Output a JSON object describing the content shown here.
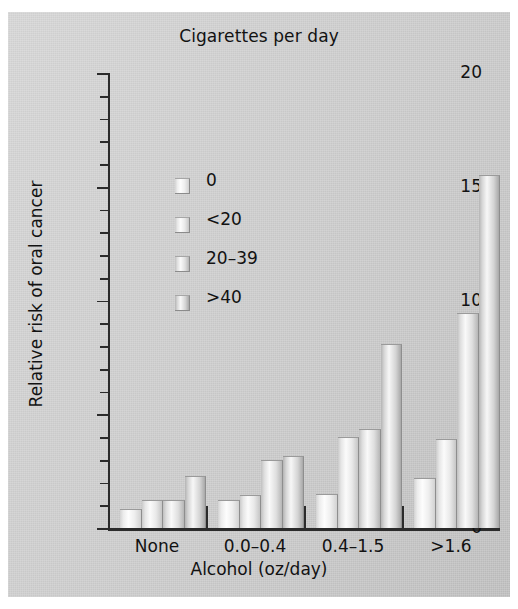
{
  "chart_data": {
    "type": "bar",
    "title": "Cigarettes per day",
    "xlabel": "Alcohol (oz/day)",
    "ylabel": "Relative risk of oral cancer",
    "categories": [
      "None",
      "0.0–0.4",
      "0.4–1.5",
      ">1.6"
    ],
    "legend_title": "Cigarettes per day",
    "legend_position": "inside-upper-left",
    "grid": false,
    "ylim": [
      0,
      20
    ],
    "yticks": [
      0,
      5,
      10,
      15,
      20
    ],
    "ytick_labels": [
      "0",
      "5",
      "10",
      "15",
      "20"
    ],
    "minor_tick_interval": 1,
    "series": [
      {
        "name": "0",
        "values": [
          0.85,
          1.25,
          1.5,
          2.2
        ]
      },
      {
        "name": "<20",
        "values": [
          1.25,
          1.45,
          4.0,
          3.9
        ]
      },
      {
        "name": "20–39",
        "values": [
          1.25,
          3.0,
          4.35,
          9.45
        ]
      },
      {
        "name": ">40",
        "values": [
          2.3,
          3.15,
          8.1,
          15.5
        ]
      }
    ]
  },
  "colors": {
    "background": "#c9c9c9",
    "axis": "#2b2b2b",
    "text": "#121212",
    "bar_highlight": "#fdfdfd",
    "bar_shadow": "#a8a8a8"
  }
}
